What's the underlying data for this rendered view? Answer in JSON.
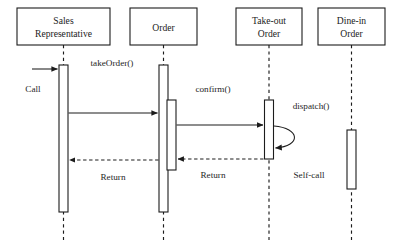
{
  "diagram": {
    "type": "uml-sequence-diagram",
    "canvas": {
      "width": 399,
      "height": 248
    },
    "colors": {
      "background": "#ffffff",
      "stroke": "#1c1c1c",
      "text": "#262626"
    },
    "participants": [
      {
        "id": "sales-representative",
        "label_line1": "Sales",
        "label_line2": "Representative",
        "box": {
          "x": 17,
          "y": 8,
          "w": 93,
          "h": 37
        },
        "lifeline_x": 63.5
      },
      {
        "id": "order",
        "label_line1": "Order",
        "label_line2": "",
        "box": {
          "x": 130,
          "y": 8,
          "w": 67,
          "h": 37
        },
        "lifeline_x": 163.5
      },
      {
        "id": "take-out-order",
        "label_line1": "Take-out",
        "label_line2": "Order",
        "box": {
          "x": 236,
          "y": 8,
          "w": 66,
          "h": 37
        },
        "lifeline_x": 269
      },
      {
        "id": "dine-in-order",
        "label_line1": "Dine-in",
        "label_line2": "Order",
        "box": {
          "x": 318,
          "y": 8,
          "w": 67,
          "h": 37
        },
        "lifeline_x": 351.5
      }
    ],
    "messages": [
      {
        "id": "call",
        "label": "Call",
        "kind": "found-call",
        "label_x": 33,
        "label_y": 92
      },
      {
        "id": "take-order",
        "label": "takeOrder()",
        "kind": "call",
        "label_x": 112,
        "label_y": 66
      },
      {
        "id": "confirm",
        "label": "confirm()",
        "kind": "call",
        "label_x": 213,
        "label_y": 92
      },
      {
        "id": "dispatch",
        "label": "dispatch()",
        "kind": "call",
        "label_x": 311,
        "label_y": 109
      },
      {
        "id": "self-call",
        "label": "Self-call",
        "kind": "self-call",
        "label_x": 309,
        "label_y": 178
      },
      {
        "id": "return-inner",
        "label": "Return",
        "kind": "return",
        "label_x": 213,
        "label_y": 178
      },
      {
        "id": "return-outer",
        "label": "Return",
        "kind": "return",
        "label_x": 113,
        "label_y": 180
      }
    ]
  }
}
